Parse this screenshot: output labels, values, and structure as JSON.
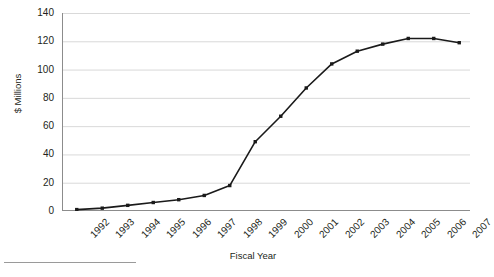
{
  "chart_data": {
    "type": "line",
    "title": "",
    "xlabel": "Fiscal Year",
    "ylabel": "$ Millions",
    "categories": [
      "1992",
      "1993",
      "1994",
      "1995",
      "1996",
      "1997",
      "1998",
      "1999",
      "2000",
      "2001",
      "2002",
      "2003",
      "2004",
      "2005",
      "2006",
      "2007"
    ],
    "values": [
      1,
      2,
      4,
      6,
      8,
      11,
      18,
      49,
      67,
      87,
      104,
      113,
      118,
      122,
      122,
      119
    ],
    "series": [
      {
        "name": "$ Millions",
        "values": [
          1,
          2,
          4,
          6,
          8,
          11,
          18,
          49,
          67,
          87,
          104,
          113,
          118,
          122,
          122,
          119
        ]
      }
    ],
    "ylim": [
      0,
      140
    ],
    "yticks": [
      0,
      20,
      40,
      60,
      80,
      100,
      120,
      140
    ],
    "ytick_labels": [
      "0",
      "20",
      "40",
      "60",
      "80",
      "100",
      "120",
      "140"
    ],
    "xtick_labels": [
      "1992",
      "1993",
      "1994",
      "1995",
      "1996",
      "1997",
      "1998",
      "1999",
      "2000",
      "2001",
      "2002",
      "2003",
      "2004",
      "2005",
      "2006",
      "2007"
    ],
    "grid": "horizontal",
    "legend": "none",
    "line_color": "#1a1a1a",
    "marker": "square",
    "marker_color": "#1a1a1a",
    "grid_color": "#d9d9d9",
    "axis_color": "#8c8c8c",
    "background": "#ffffff",
    "annotations": []
  },
  "axes": {
    "y_title": "$ Millions",
    "x_title": "Fiscal Year"
  }
}
